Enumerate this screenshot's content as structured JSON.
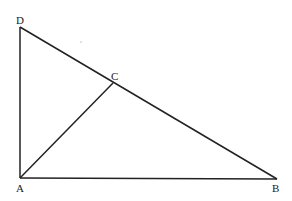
{
  "diagram": {
    "points": {
      "A": {
        "label": "A",
        "x": 20,
        "y": 178
      },
      "B": {
        "label": "B",
        "x": 277,
        "y": 178
      },
      "C": {
        "label": "C",
        "x": 113,
        "y": 83
      },
      "D": {
        "label": "D",
        "x": 20,
        "y": 27
      }
    },
    "segments": [
      "DA",
      "AB",
      "BD",
      "AC"
    ],
    "stroke_color": "#222222"
  }
}
